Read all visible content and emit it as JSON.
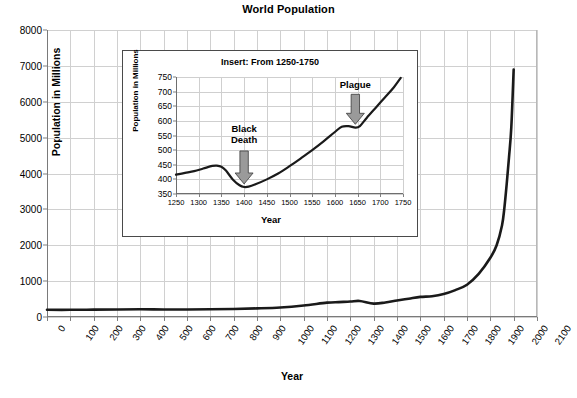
{
  "main": {
    "title": "World Population",
    "xlabel": "Year",
    "ylabel": "Population in Millions"
  },
  "inset": {
    "title": "Insert: From 1250-1750",
    "xlabel": "Year",
    "ylabel": "Population in Millions",
    "annotations": [
      {
        "name": "black-death",
        "text": "Black\nDeath"
      },
      {
        "name": "plague",
        "text": "Plague"
      }
    ]
  },
  "colors": {
    "curve": "#1a1a1a",
    "grid": "#d0d0d0",
    "axis": "#7a7a7a",
    "inset_border": "#4a4a4a",
    "arrow_fill": "#9a9a9a",
    "arrow_stroke": "#3a3a3a",
    "text": "#000000",
    "background": "#ffffff"
  },
  "bottom_caption": "",
  "chart_data": [
    {
      "type": "line",
      "name": "main-world-population",
      "title": "World Population",
      "xlabel": "Year",
      "ylabel": "Population in Millions",
      "xlim": [
        0,
        2100
      ],
      "ylim": [
        0,
        8000
      ],
      "xticks": [
        0,
        100,
        200,
        300,
        400,
        500,
        600,
        700,
        800,
        900,
        1000,
        1100,
        1200,
        1300,
        1400,
        1500,
        1600,
        1700,
        1800,
        1900,
        2000,
        2100
      ],
      "yticks": [
        0,
        1000,
        2000,
        3000,
        4000,
        5000,
        6000,
        7000,
        8000
      ],
      "grid": true,
      "legend": "none",
      "x": [
        0,
        100,
        200,
        300,
        400,
        500,
        600,
        700,
        800,
        900,
        1000,
        1100,
        1200,
        1250,
        1300,
        1340,
        1400,
        1450,
        1500,
        1550,
        1600,
        1650,
        1700,
        1750,
        1800,
        1850,
        1900,
        1927,
        1950,
        1960,
        1970,
        1980,
        1990,
        2000
      ],
      "y": [
        200,
        200,
        205,
        210,
        215,
        210,
        210,
        215,
        225,
        240,
        265,
        320,
        400,
        416,
        430,
        447,
        374,
        405,
        460,
        510,
        560,
        580,
        640,
        750,
        900,
        1200,
        1650,
        2000,
        2550,
        3030,
        3700,
        4450,
        5300,
        6900
      ]
    },
    {
      "type": "line",
      "name": "inset-1250-1750",
      "title": "Insert: From 1250-1750",
      "xlabel": "Year",
      "ylabel": "Population in Millions",
      "xlim": [
        1250,
        1750
      ],
      "ylim": [
        350,
        750
      ],
      "xticks": [
        1250,
        1300,
        1350,
        1400,
        1450,
        1500,
        1550,
        1600,
        1650,
        1700,
        1750
      ],
      "yticks": [
        350,
        400,
        450,
        500,
        550,
        600,
        650,
        700,
        750
      ],
      "grid": true,
      "legend": "none",
      "annotations": [
        {
          "label": "Black Death",
          "x": 1400,
          "y": 374
        },
        {
          "label": "Plague",
          "x": 1645,
          "y": 578
        }
      ],
      "x": [
        1250,
        1270,
        1290,
        1310,
        1330,
        1340,
        1350,
        1360,
        1375,
        1390,
        1400,
        1410,
        1425,
        1450,
        1475,
        1500,
        1525,
        1550,
        1575,
        1600,
        1615,
        1630,
        1645,
        1655,
        1670,
        1690,
        1710,
        1730,
        1745
      ],
      "y": [
        416,
        422,
        428,
        437,
        446,
        447,
        443,
        430,
        400,
        380,
        374,
        375,
        383,
        400,
        420,
        445,
        472,
        500,
        530,
        562,
        580,
        582,
        577,
        582,
        610,
        645,
        680,
        715,
        747
      ]
    }
  ]
}
